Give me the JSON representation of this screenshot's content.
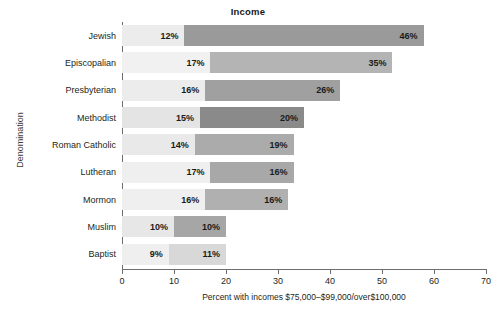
{
  "chart_data": {
    "type": "bar",
    "orientation": "horizontal",
    "stacked": true,
    "title": "Income",
    "xlabel": "Percent with incomes $75,000–$99,000/over$100,000",
    "ylabel": "Denomination",
    "xlim": [
      0,
      70
    ],
    "xticks": [
      0,
      10,
      20,
      30,
      40,
      50,
      60,
      70
    ],
    "grid": false,
    "legend": "none",
    "categories": [
      "Jewish",
      "Episcopalian",
      "Presbyterian",
      "Methodist",
      "Roman Catholic",
      "Lutheran",
      "Mormon",
      "Muslim",
      "Baptist"
    ],
    "series": [
      {
        "name": "$75,000–$99,000",
        "values": [
          12,
          17,
          16,
          15,
          14,
          17,
          16,
          10,
          9
        ],
        "labels": [
          "12%",
          "17%",
          "16%",
          "15%",
          "14%",
          "17%",
          "16%",
          "10%",
          "9%"
        ],
        "color": "#e8e8e8"
      },
      {
        "name": "over $100,000",
        "values": [
          46,
          35,
          26,
          20,
          19,
          16,
          16,
          10,
          11
        ],
        "labels": [
          "46%",
          "35%",
          "26%",
          "20%",
          "19%",
          "16%",
          "16%",
          "10%",
          "11%"
        ],
        "colors": [
          "#9a9a9a",
          "#b4b4b4",
          "#a0a0a0",
          "#8a8a8a",
          "#ababab",
          "#a8a8a8",
          "#b0b0b0",
          "#a6a6a6",
          "#d8d8d8"
        ]
      }
    ],
    "segment1_colors": [
      "#ececec",
      "#f1f1f1",
      "#ececec",
      "#e4e4e4",
      "#e9e9e9",
      "#efefef",
      "#efefef",
      "#e7e7e7",
      "#efefef"
    ]
  }
}
